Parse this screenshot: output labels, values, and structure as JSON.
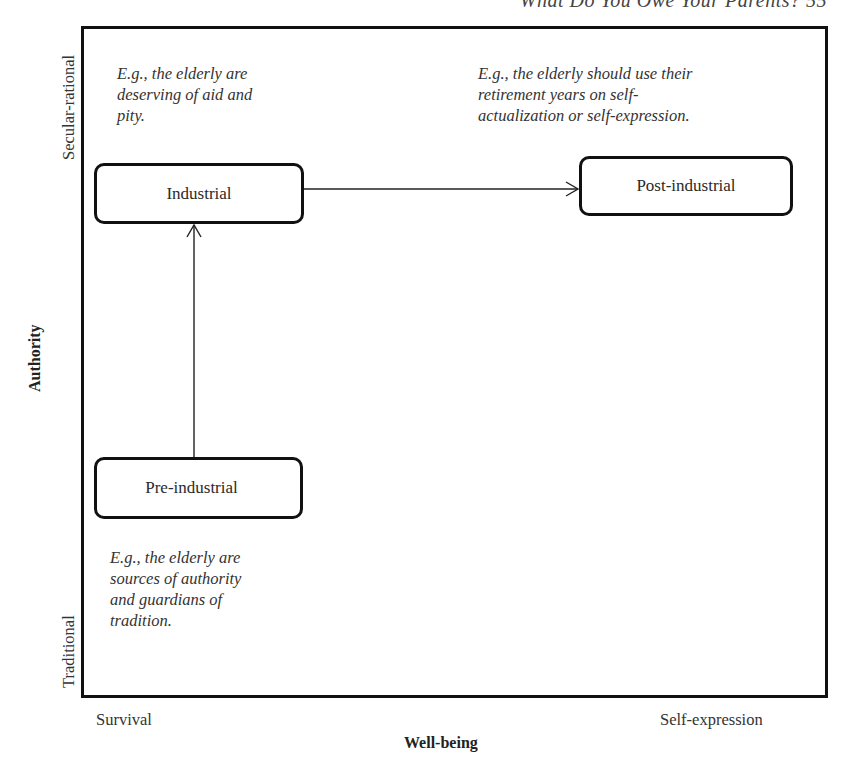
{
  "header": {
    "running_title": "What Do You Owe Your Parents?   55"
  },
  "diagram": {
    "nodes": [
      {
        "id": "industrial",
        "label": "Industrial"
      },
      {
        "id": "post_industrial",
        "label": "Post-industrial"
      },
      {
        "id": "pre_industrial",
        "label": "Pre-industrial"
      }
    ],
    "edges": [
      {
        "from": "pre_industrial",
        "to": "industrial"
      },
      {
        "from": "industrial",
        "to": "post_industrial"
      }
    ],
    "notes": {
      "industrial": [
        "E.g., the elderly are",
        "deserving of aid and",
        "pity."
      ],
      "post_industrial": [
        "E.g., the elderly should use their",
        "retirement years on self-",
        "actualization or self-expression."
      ],
      "pre_industrial": [
        "E.g., the elderly are",
        "sources of authority",
        "and guardians of",
        "tradition."
      ]
    }
  },
  "axes": {
    "x": {
      "title": "Well-being",
      "low": "Survival",
      "high": "Self-expression"
    },
    "y": {
      "title": "Authority",
      "low": "Traditional",
      "high": "Secular-rational"
    }
  },
  "colors": {
    "line": "#111111",
    "text": "#2a2a2a",
    "background": "#ffffff"
  }
}
